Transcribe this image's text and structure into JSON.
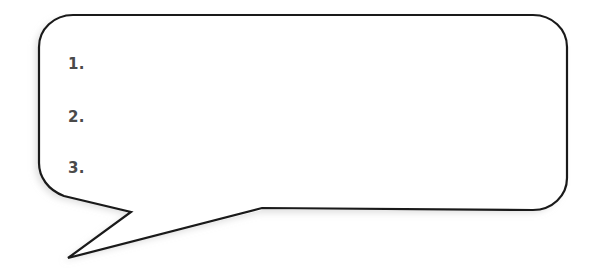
{
  "canvas": {
    "width": 599,
    "height": 268,
    "background_color": "#ffffff"
  },
  "bubble": {
    "shape_name": "speech-bubble",
    "stroke_color": "#1a1a1a",
    "fill_color": "#ffffff",
    "stroke_width": 2.2,
    "shadow_color": "#e6e6e6",
    "corner_radius": 34,
    "body": {
      "left": 39,
      "top": 15,
      "right": 567,
      "bottom": 210
    },
    "tail": {
      "name": "zigzag-tail",
      "direction": "down-left",
      "points": [
        {
          "x": 64,
          "y": 196
        },
        {
          "x": 131,
          "y": 212
        },
        {
          "x": 68,
          "y": 258
        },
        {
          "x": 262,
          "y": 208
        }
      ]
    }
  },
  "list": {
    "name": "numbered-list",
    "marker_color": "#4a4a4a",
    "items": [
      {
        "marker": "1.",
        "text": ""
      },
      {
        "marker": "2.",
        "text": ""
      },
      {
        "marker": "3.",
        "text": ""
      }
    ]
  }
}
